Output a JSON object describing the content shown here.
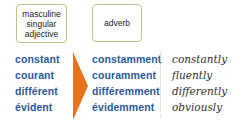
{
  "headers": {
    "adjective_box": [
      "masculine",
      "singular",
      "adjective"
    ],
    "adverb_box": "adverb"
  },
  "colors": {
    "french_words": "#2b5aa0",
    "arrow": "#e8731f",
    "box_border": "#b9c48a"
  },
  "rows": [
    {
      "adjective": "constant",
      "adverb": "constamment",
      "english": "constantly"
    },
    {
      "adjective": "courant",
      "adverb": "couramment",
      "english": "fluently"
    },
    {
      "adjective": "différent",
      "adverb": "différemment",
      "english": "differently"
    },
    {
      "adjective": "évident",
      "adverb": "évidemment",
      "english": "obviously"
    }
  ],
  "icons": {
    "arrow": "arrow-right-icon"
  }
}
